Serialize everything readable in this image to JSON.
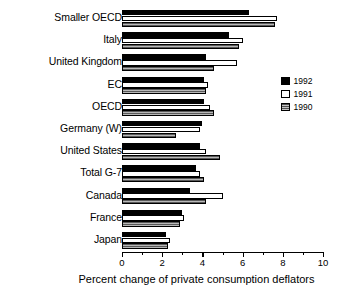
{
  "chart_data": {
    "type": "bar",
    "orientation": "horizontal",
    "title": "",
    "xlabel": "Percent change of private consumption deflators",
    "ylabel": "",
    "xlim": [
      0,
      10
    ],
    "xticks": [
      0,
      1,
      2,
      3,
      4,
      5,
      6,
      7,
      8,
      9,
      10
    ],
    "xtick_labels": [
      "0",
      "",
      "2",
      "",
      "4",
      "",
      "6",
      "",
      "8",
      "",
      "10"
    ],
    "grid": false,
    "legend_position": "right",
    "categories": [
      "Smaller OECD",
      "Italy",
      "United Kingdom",
      "EC",
      "OECD",
      "Germany (W)",
      "United States",
      "Total G-7",
      "Canada",
      "France",
      "Japan"
    ],
    "series": [
      {
        "name": "1992",
        "color": "#000000",
        "values": [
          6.3,
          5.3,
          4.2,
          4.1,
          4.1,
          4.0,
          3.9,
          3.7,
          3.4,
          3.0,
          2.2
        ]
      },
      {
        "name": "1991",
        "color": "#ffffff",
        "values": [
          7.7,
          6.0,
          5.7,
          4.3,
          4.4,
          3.9,
          4.2,
          3.9,
          5.0,
          3.1,
          2.4
        ]
      },
      {
        "name": "1990",
        "color": "#808080",
        "values": [
          7.6,
          5.8,
          4.6,
          4.2,
          4.6,
          2.7,
          4.9,
          4.1,
          4.2,
          2.9,
          2.3
        ]
      }
    ]
  },
  "legend": {
    "items": [
      {
        "label": "1992"
      },
      {
        "label": "1991"
      },
      {
        "label": "1990"
      }
    ]
  }
}
